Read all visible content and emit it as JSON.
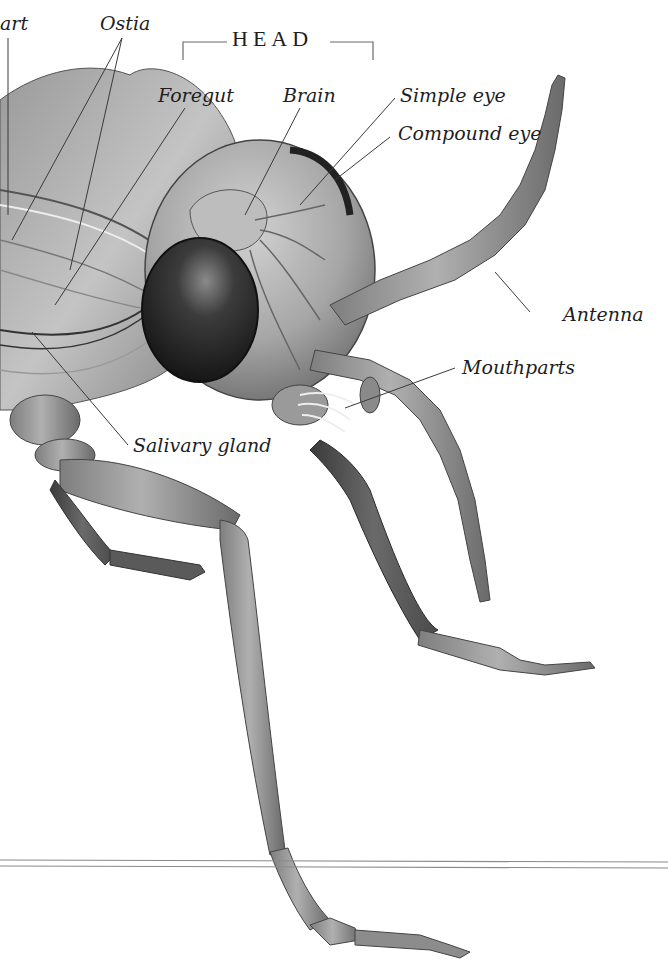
{
  "diagram": {
    "section_title": "HEAD",
    "labels": [
      {
        "id": "heart",
        "text": "art"
      },
      {
        "id": "ostia",
        "text": "Ostia"
      },
      {
        "id": "foregut",
        "text": "Foregut"
      },
      {
        "id": "brain",
        "text": "Brain"
      },
      {
        "id": "simple-eye",
        "text": "Simple eye"
      },
      {
        "id": "compound-eye",
        "text": "Compound eye"
      },
      {
        "id": "antenna",
        "text": "Antenna"
      },
      {
        "id": "mouthparts",
        "text": "Mouthparts"
      },
      {
        "id": "salivary-gland",
        "text": "Salivary gland"
      }
    ],
    "colors": {
      "background": "#ffffff",
      "text": "#1e1e1e",
      "leader_line": "#3a3a3a",
      "rule": "#8a8a8a",
      "body_mid": "#8c8c8c",
      "body_light": "#b8b8b8",
      "eye_dark": "#2a2a2a"
    }
  }
}
